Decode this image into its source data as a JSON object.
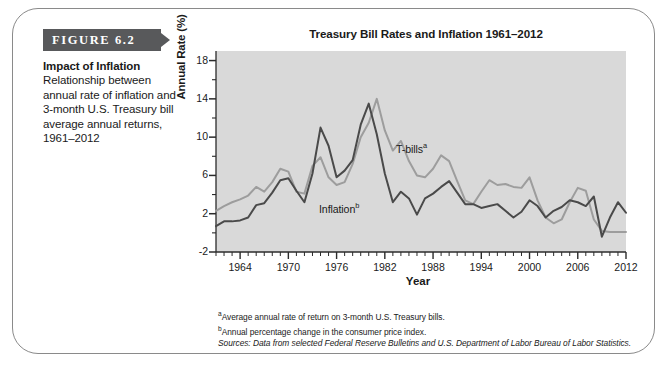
{
  "figure": {
    "banner_label": "FIGURE 6.2",
    "caption_title": "Impact of Inflation",
    "caption_body": "Relationship between annual rate of inflation and 3-month U.S. Treasury bill average annual returns, 1961–2012"
  },
  "chart_title": "Treasury Bill Rates and Inflation 1961–2012",
  "notes": {
    "note_a_marker": "a",
    "note_a": "Average annual rate of return on 3-month U.S. Treasury bills.",
    "note_b_marker": "b",
    "note_b": "Annual percentage change in the consumer price index.",
    "sources_lead": "Sources:",
    "sources_text": " Data from selected Federal Reserve Bulletins and U.S. Department of Labor Bureau of Labor Statistics."
  },
  "colors": {
    "banner": "#58595b",
    "plot_background": "#d9d9d9",
    "inflation_line": "#4a4a4a",
    "tbills_line": "#9d9d9d",
    "card_border": "#8a8a8a"
  },
  "chart_data": {
    "type": "line",
    "title": "Treasury Bill Rates and Inflation 1961–2012",
    "xlabel": "Year",
    "ylabel": "Annual Rate (%)",
    "xlim": [
      1961,
      2012
    ],
    "ylim": [
      -2,
      19
    ],
    "yticks": [
      -2,
      2,
      6,
      10,
      14,
      18
    ],
    "ytick_labels": [
      "-2",
      "2",
      "6",
      "10",
      "14",
      "18"
    ],
    "xticks": [
      1964,
      1970,
      1976,
      1982,
      1988,
      1994,
      2000,
      2006,
      2012
    ],
    "xtick_labels": [
      "1964",
      "1970",
      "1976",
      "1982",
      "1988",
      "1994",
      "2000",
      "2006",
      "2012"
    ],
    "minor_xtick_interval": 1,
    "minor_ytick_interval": 2,
    "grid": false,
    "legend": "inline-labels",
    "x": [
      1961,
      1962,
      1963,
      1964,
      1965,
      1966,
      1967,
      1968,
      1969,
      1970,
      1971,
      1972,
      1973,
      1974,
      1975,
      1976,
      1977,
      1978,
      1979,
      1980,
      1981,
      1982,
      1983,
      1984,
      1985,
      1986,
      1987,
      1988,
      1989,
      1990,
      1991,
      1992,
      1993,
      1994,
      1995,
      1996,
      1997,
      1998,
      1999,
      2000,
      2001,
      2002,
      2003,
      2004,
      2005,
      2006,
      2007,
      2008,
      2009,
      2010,
      2011,
      2012
    ],
    "series": [
      {
        "name": "T-bills",
        "label": "T-bills",
        "label_superscript": "a",
        "color": "#9d9d9d",
        "values": [
          2.3,
          2.8,
          3.2,
          3.5,
          3.9,
          4.8,
          4.3,
          5.3,
          6.7,
          6.4,
          4.3,
          4.1,
          7.0,
          7.9,
          5.8,
          5.0,
          5.3,
          7.2,
          10.0,
          11.5,
          14.0,
          10.7,
          8.6,
          9.6,
          7.5,
          6.0,
          5.8,
          6.7,
          8.1,
          7.5,
          5.4,
          3.4,
          3.0,
          4.3,
          5.5,
          5.0,
          5.1,
          4.8,
          4.7,
          5.8,
          3.4,
          1.6,
          1.0,
          1.4,
          3.2,
          4.7,
          4.4,
          1.4,
          0.2,
          0.1,
          0.1,
          0.1
        ]
      },
      {
        "name": "Inflation",
        "label": "Inflation",
        "label_superscript": "b",
        "color": "#4a4a4a",
        "values": [
          0.7,
          1.2,
          1.2,
          1.3,
          1.6,
          2.9,
          3.1,
          4.2,
          5.5,
          5.7,
          4.4,
          3.2,
          6.2,
          11.0,
          9.1,
          5.8,
          6.5,
          7.6,
          11.3,
          13.5,
          10.3,
          6.2,
          3.2,
          4.3,
          3.6,
          1.9,
          3.6,
          4.1,
          4.8,
          5.4,
          4.2,
          3.0,
          3.0,
          2.6,
          2.8,
          3.0,
          2.3,
          1.6,
          2.2,
          3.4,
          2.8,
          1.6,
          2.3,
          2.7,
          3.4,
          3.2,
          2.8,
          3.8,
          -0.4,
          1.6,
          3.2,
          2.1
        ]
      }
    ]
  }
}
